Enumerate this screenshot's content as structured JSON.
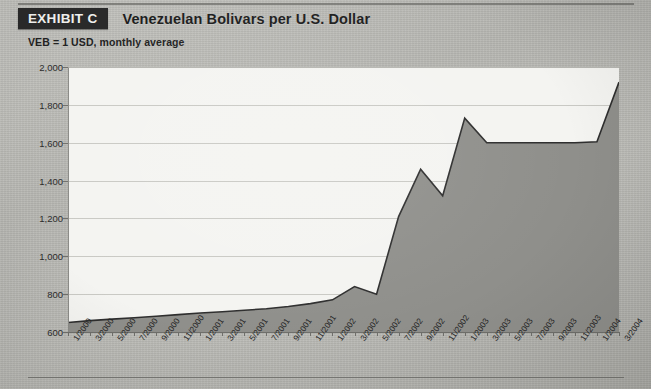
{
  "header": {
    "badge_label": "EXHIBIT C",
    "title": "Venezuelan Bolivars per U.S. Dollar",
    "subtitle": "VEB = 1 USD, monthly average"
  },
  "colors": {
    "badge_bg": "#2a2a2a",
    "badge_text": "#f2f2f0",
    "plot_bg": "#f4f4f1",
    "area_fill": "#8f8f8b",
    "line": "#2e2e2e",
    "grid": "#c9c9c4",
    "page_bg": "#b9b9b5"
  },
  "chart_data": {
    "type": "area",
    "title": "Venezuelan Bolivars per U.S. Dollar",
    "subtitle": "VEB = 1 USD, monthly average",
    "xlabel": "",
    "ylabel": "",
    "ylim": [
      600,
      2000
    ],
    "ytick_step": 200,
    "ytick_labels": [
      "600",
      "800",
      "1,000",
      "1,200",
      "1,400",
      "1,600",
      "1,800",
      "2,000"
    ],
    "ytick_values": [
      600,
      800,
      1000,
      1200,
      1400,
      1600,
      1800,
      2000
    ],
    "grid": true,
    "legend": "none",
    "categories": [
      "1/2000",
      "3/2000",
      "5/2000",
      "7/2000",
      "9/2000",
      "11/2000",
      "1/2001",
      "3/2001",
      "5/2001",
      "7/2001",
      "9/2001",
      "11/2001",
      "1/2002",
      "3/2002",
      "5/2002",
      "7/2002",
      "9/2002",
      "11/2002",
      "1/2003",
      "3/2003",
      "5/2003",
      "7/2003",
      "9/2003",
      "11/2003",
      "1/2004",
      "3/2004"
    ],
    "values": [
      650,
      660,
      668,
      675,
      683,
      692,
      700,
      707,
      715,
      723,
      735,
      750,
      770,
      840,
      800,
      1210,
      1460,
      1320,
      1730,
      1600,
      1600,
      1600,
      1600,
      1600,
      1605,
      1920
    ]
  }
}
